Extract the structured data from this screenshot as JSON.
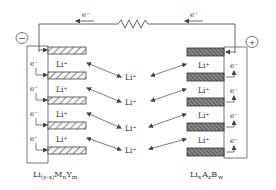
{
  "diagram": {
    "type": "lithium-ion battery discharge schematic",
    "external_circuit": {
      "electron_label_left": "e⁻",
      "electron_label_right": "e⁻",
      "component": "resistor"
    },
    "terminals": {
      "negative_symbol": "−",
      "positive_symbol": "+"
    },
    "negative_electrode": {
      "formula_main": "Li",
      "formula_sub1": "(y-x)",
      "formula_M": "M",
      "formula_sub2": "n",
      "formula_Y": "Y",
      "formula_sub3": "m",
      "electron_labels": [
        "e⁻",
        "e⁻",
        "e⁻",
        "e⁻"
      ],
      "ion_labels": [
        "Li⁺",
        "Li⁺",
        "Li⁺",
        "Li⁺"
      ]
    },
    "positive_electrode": {
      "formula_main": "Li",
      "formula_sub1": "x",
      "formula_A": "A",
      "formula_sub2": "z",
      "formula_B": "B",
      "formula_sub3": "w",
      "electron_labels": [
        "e⁻",
        "e⁻",
        "e⁻",
        "e⁻"
      ],
      "ion_labels": [
        "Li⁺",
        "Li⁺",
        "Li⁺",
        "Li⁺"
      ]
    },
    "electrolyte_ion_labels": [
      "Li⁺",
      "Li⁺",
      "Li⁺",
      "Li⁺"
    ],
    "colors": {
      "line": "#555555",
      "anode_hatch": "#666666",
      "cathode_fill": "#5a5a5a"
    }
  }
}
